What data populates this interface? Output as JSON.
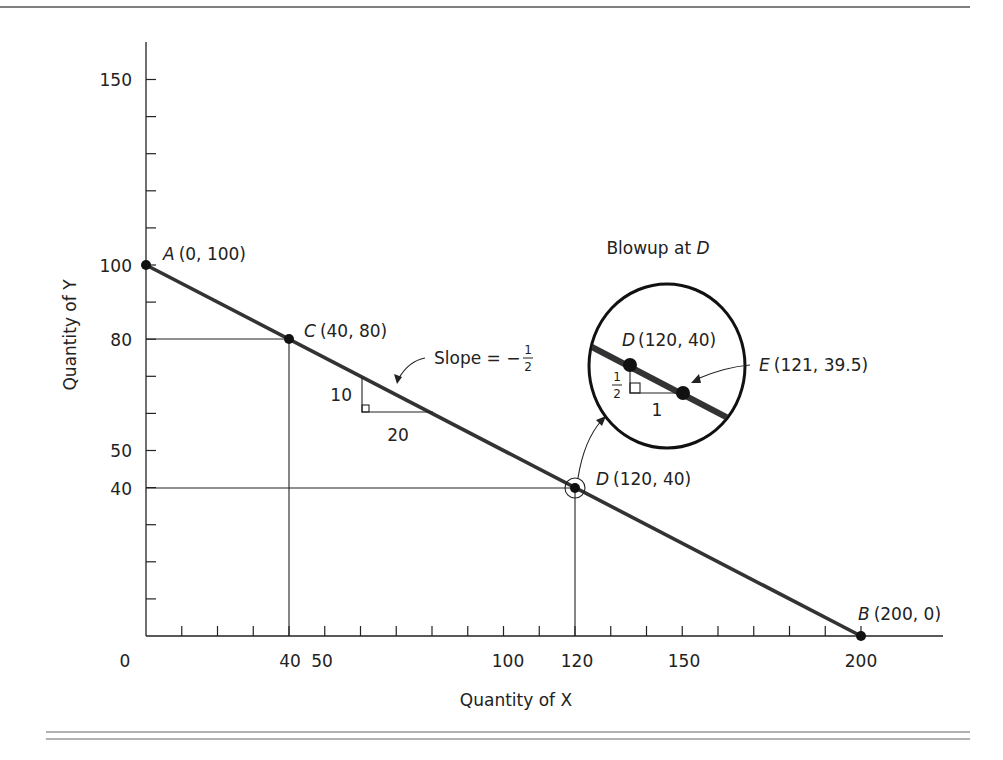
{
  "chart_data": {
    "type": "line",
    "xlabel": "Quantity of X",
    "ylabel": "Quantity of Y",
    "xlim": [
      0,
      200
    ],
    "ylim": [
      0,
      150
    ],
    "x_tick_labels": [
      "0",
      "40",
      "50",
      "100",
      "120",
      "150",
      "200"
    ],
    "y_tick_labels": [
      "150",
      "100",
      "80",
      "50",
      "40"
    ],
    "series": [
      {
        "name": "budget line",
        "x": [
          0,
          200
        ],
        "y": [
          100,
          0
        ]
      }
    ],
    "points": [
      {
        "label": "A",
        "coords": "(0, 100)",
        "x": 0,
        "y": 100
      },
      {
        "label": "C",
        "coords": "(40, 80)",
        "x": 40,
        "y": 80
      },
      {
        "label": "D",
        "coords": "(120, 40)",
        "x": 120,
        "y": 40
      },
      {
        "label": "B",
        "coords": "(200, 0)",
        "x": 200,
        "y": 0
      }
    ],
    "annotations": {
      "slope_text": "Slope = −",
      "slope_num": "1",
      "slope_den": "2",
      "rise": "10",
      "run": "20",
      "blowup_title": "Blowup at ",
      "blowup_point": "D",
      "blowup_D_label": "D",
      "blowup_D_coords": "(120, 40)",
      "blowup_E_label": "E",
      "blowup_E_coords": "(121, 39.5)",
      "blowup_rise_num": "1",
      "blowup_rise_den": "2",
      "blowup_run": "1"
    }
  }
}
